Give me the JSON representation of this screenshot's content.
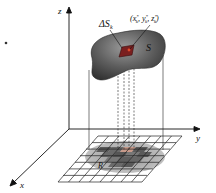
{
  "diagram": {
    "type": "surface-integral-illustration",
    "labels": {
      "z_axis": "z",
      "y_axis": "y",
      "x_axis": "x",
      "surface": "S",
      "region": "R",
      "delta_s_base": "ΔS",
      "delta_s_sub": "k",
      "point": "(x",
      "point_x_sup": "*",
      "point_x_sub": "k",
      "point_sep1": ", y",
      "point_y_sup": "*",
      "point_y_sub": "k",
      "point_sep2": ", z",
      "point_z_sup": "*",
      "point_z_sub": "k",
      "point_close": ")"
    },
    "colors": {
      "surface": "#555555",
      "surface_highlight": "#8a8a8a",
      "patch": "#8b1a1a",
      "grid_line": "#222222",
      "shadow_dark": "#6e6e6e",
      "shadow_light": "#bdbdbd",
      "projection_patch": "#c89a8a"
    }
  }
}
